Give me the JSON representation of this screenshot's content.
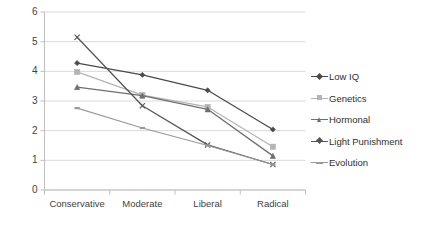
{
  "chart_data": {
    "type": "line",
    "title": "",
    "xlabel": "",
    "ylabel": "",
    "categories": [
      "Conservative",
      "Moderate",
      "Liberal",
      "Radical"
    ],
    "ylim": [
      0,
      6
    ],
    "yticks": [
      0,
      1,
      2,
      3,
      4,
      5,
      6
    ],
    "grid": true,
    "legend_position": "right",
    "series": [
      {
        "name": "Low IQ",
        "values": [
          4.28,
          3.88,
          3.36,
          2.04
        ],
        "color": "#4a4a4a",
        "marker": "diamond"
      },
      {
        "name": "Genetics",
        "values": [
          3.98,
          3.2,
          2.8,
          1.46
        ],
        "color": "#b4b4b4",
        "marker": "square"
      },
      {
        "name": "Hormonal",
        "values": [
          3.47,
          3.18,
          2.72,
          1.15
        ],
        "color": "#6e6e6e",
        "marker": "triangle"
      },
      {
        "name": "Light Punishment",
        "values": [
          5.15,
          2.84,
          1.52,
          0.86
        ],
        "color": "#555555",
        "marker": "cross"
      },
      {
        "name": "Evolution",
        "values": [
          2.76,
          2.09,
          1.5,
          0.86
        ],
        "color": "#9a9a9a",
        "marker": "dash"
      }
    ]
  },
  "axis": {
    "y_labels": [
      "6",
      "5",
      "4",
      "3",
      "2",
      "1",
      "0"
    ],
    "x_labels": [
      "Conservative",
      "Moderate",
      "Liberal",
      "Radical"
    ]
  },
  "legend": {
    "items": [
      {
        "label": "Low IQ"
      },
      {
        "label": "Genetics"
      },
      {
        "label": "Hormonal"
      },
      {
        "label": "Light Punishment"
      },
      {
        "label": "Evolution"
      }
    ]
  },
  "style": {
    "grid_color": "#d9d9d9",
    "axis_color": "#bfbfbf",
    "text_color": "#3f3f3f",
    "background": "#ffffff"
  }
}
